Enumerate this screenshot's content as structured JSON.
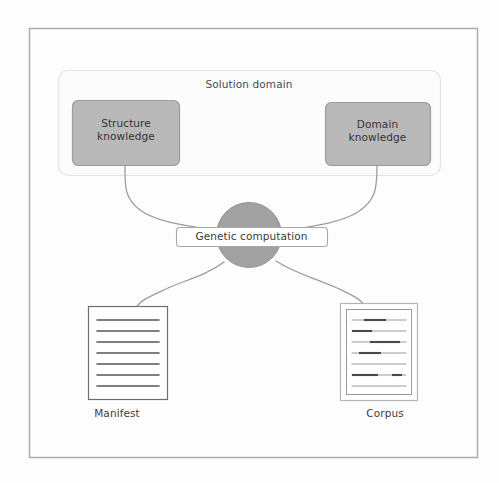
{
  "diagram": {
    "title_visible": false,
    "background_color": "#fdfdfd",
    "frame": {
      "name": "outer-frame",
      "stroke": "#a8a8a8"
    },
    "solution_domain": {
      "label": "Solution domain",
      "container_stroke": "#e3e3e3",
      "container_fill": "#fcfcfc"
    },
    "nodes": [
      {
        "id": "structure-knowledge",
        "label": "Structure\nknowledge",
        "shape": "rounded-rect",
        "fill": "#b9b9b9",
        "stroke": "#9a9a9a"
      },
      {
        "id": "domain-knowledge",
        "label": "Domain\nknowledge",
        "shape": "rounded-rect",
        "fill": "#b9b9b9",
        "stroke": "#9a9a9a"
      },
      {
        "id": "genetic-computation",
        "label": "Genetic computation",
        "shape": "circle",
        "fill": "#a0a0a0",
        "stroke": "#949494",
        "pill_fill": "#ffffff",
        "pill_stroke": "#a6a6a6"
      },
      {
        "id": "manifest",
        "label": "Manifest",
        "shape": "document",
        "fill": "#ffffff",
        "stroke": "#6f6f6f",
        "line_count": 7
      },
      {
        "id": "corpus",
        "label": "Corpus",
        "shape": "document-framed",
        "fill": "#ffffff",
        "stroke": "#8a8a8a",
        "line_count": 7,
        "has_highlights": true
      }
    ],
    "edges": [
      {
        "from": "structure-knowledge",
        "to": "genetic-computation",
        "style": "curved"
      },
      {
        "from": "domain-knowledge",
        "to": "genetic-computation",
        "style": "curved"
      },
      {
        "from": "genetic-computation",
        "to": "manifest",
        "style": "curved"
      },
      {
        "from": "genetic-computation",
        "to": "corpus",
        "style": "curved"
      }
    ],
    "edge_stroke": "#9b9b9b"
  }
}
